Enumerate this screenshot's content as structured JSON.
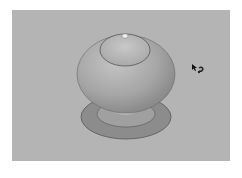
{
  "viewport": {
    "label": "3D model viewport",
    "background": "#b4b4b4",
    "model": {
      "name": "knob",
      "body_color": "#a8a8a8",
      "base_color": "#8e8e8e"
    },
    "cursor": {
      "icon": "orbit-cursor-icon"
    }
  }
}
